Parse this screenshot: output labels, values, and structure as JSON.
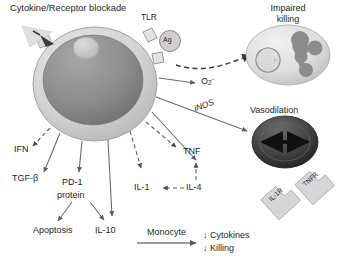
{
  "diagram": {
    "title": "Cytokine/Receptor blockade",
    "background_color": "#ffffff",
    "text_color": "#262626"
  },
  "central_cell": {
    "name": "macrophage",
    "membrane_color": "#c9c9c9",
    "nucleus_color": "#8c8c8c",
    "nucleolus_color": "#c2c2c2"
  },
  "receptors": {
    "tlr_label": "TLR",
    "antigen_label": "Ag",
    "blocked_receptor_label": ""
  },
  "surface_receptor_icons": [
    {
      "label": "IL-1R",
      "name": "il1r-receptor-icon"
    },
    {
      "label": "TNFR",
      "name": "tnfr-receptor-icon"
    }
  ],
  "outputs": {
    "impaired_killing": "Impaired\nkilling",
    "impaired_killing_line1": "Impaired",
    "impaired_killing_line2": "killing",
    "superoxide": "O",
    "superoxide_sub": "2",
    "superoxide_sup": "-",
    "inos": "iNOS",
    "vasodilation": "Vasodilation"
  },
  "mediators": [
    {
      "id": "ifn",
      "label": "IFN",
      "arrow": "dashed"
    },
    {
      "id": "tgfb",
      "label": "TGF-β",
      "arrow": "solid"
    },
    {
      "id": "pd1a",
      "label": "PD-1",
      "arrow": "solid"
    },
    {
      "id": "pd1b",
      "label": "protein",
      "arrow": "none"
    },
    {
      "id": "il10",
      "label": "IL-10",
      "arrow": "solid"
    },
    {
      "id": "apop",
      "label": "Apoptosis",
      "arrow": "solid"
    },
    {
      "id": "il1",
      "label": "IL-1",
      "arrow": "dashed"
    },
    {
      "id": "il4",
      "label": "IL-4",
      "arrow": "dashed"
    },
    {
      "id": "tnf",
      "label": "TNF",
      "arrow": "dashed"
    }
  ],
  "monocyte_pathway": {
    "source_label": "Monocyte",
    "effects": [
      {
        "arrow": "↓",
        "label": "Cytokines"
      },
      {
        "arrow": "↓",
        "label": "Killing"
      }
    ]
  },
  "colors": {
    "stroke": "#6e6e6e",
    "dark_cell": "#3a3a3a",
    "light_cell": "#dcdcdc",
    "blob": "#8a8a8a",
    "blockade_triangle": "#d8d8d8",
    "receptor_box": "#cfcfcf"
  }
}
